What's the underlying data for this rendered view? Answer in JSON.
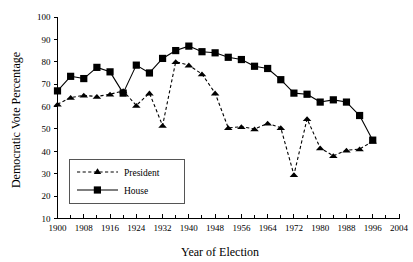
{
  "chart_data": {
    "type": "line",
    "title": "",
    "xlabel": "Year of Election",
    "ylabel": "Democratic Vote Percentage",
    "xlim": [
      1900,
      2004
    ],
    "ylim": [
      10,
      100
    ],
    "xticks": [
      1900,
      1908,
      1916,
      1924,
      1932,
      1940,
      1948,
      1956,
      1964,
      1972,
      1980,
      1988,
      1996,
      2004
    ],
    "xtick_labels": [
      "1900",
      "1908",
      "1916",
      "1924",
      "1932",
      "1940",
      "1948",
      "1956",
      "1964",
      "1972",
      "1980",
      "1988",
      "1996",
      "2004"
    ],
    "minor_xtick_interval": 4,
    "yticks": [
      10,
      20,
      30,
      40,
      50,
      60,
      70,
      80,
      90,
      100
    ],
    "ytick_labels": [
      "10",
      "20",
      "30",
      "40",
      "50",
      "60",
      "70",
      "80",
      "90",
      "100"
    ],
    "grid": false,
    "legend_position": "lower-left-inside",
    "series": [
      {
        "name": "President",
        "marker": "triangle",
        "linestyle": "dashed",
        "color": "#000000",
        "x": [
          1900,
          1904,
          1908,
          1912,
          1916,
          1920,
          1924,
          1928,
          1932,
          1936,
          1940,
          1944,
          1948,
          1952,
          1956,
          1960,
          1964,
          1968,
          1972,
          1976,
          1980,
          1984,
          1988,
          1992,
          1996
        ],
        "values": [
          61,
          64,
          65,
          64.5,
          65.5,
          67,
          60.5,
          66,
          51.5,
          80,
          78.5,
          74.5,
          66,
          50.5,
          51,
          50,
          52.5,
          50.5,
          29.5,
          54.5,
          41.5,
          38,
          40.5,
          41,
          44.5
        ]
      },
      {
        "name": "House",
        "marker": "square",
        "linestyle": "solid",
        "color": "#000000",
        "x": [
          1900,
          1904,
          1908,
          1912,
          1916,
          1920,
          1924,
          1928,
          1932,
          1936,
          1940,
          1944,
          1948,
          1952,
          1956,
          1960,
          1964,
          1968,
          1972,
          1976,
          1980,
          1984,
          1988,
          1992,
          1996
        ],
        "values": [
          67,
          73.5,
          72.5,
          77.5,
          75.5,
          66,
          78.5,
          75,
          81.5,
          85,
          87,
          84.5,
          84,
          82,
          81,
          78,
          77,
          72,
          66,
          65.5,
          62,
          63,
          62,
          56,
          45
        ]
      }
    ]
  },
  "legend": {
    "entries": [
      {
        "label": "President"
      },
      {
        "label": "House"
      }
    ]
  }
}
